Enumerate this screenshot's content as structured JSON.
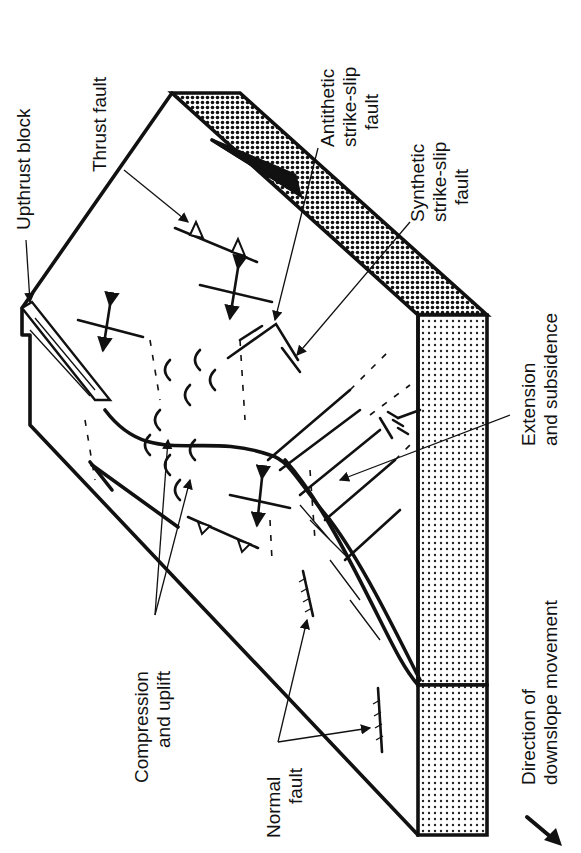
{
  "figure": {
    "type": "block-diagram",
    "orientation": "rotated 90° counter-clockwise (text reads bottom-to-top)",
    "colors": {
      "ink": "#111111",
      "background": "#ffffff",
      "stipple_fill": "#d9d9d9",
      "dense_stipple_fill": "#8c8c8c"
    }
  },
  "labels": {
    "upthrust_block": "Upthrust block",
    "thrust_fault": "Thrust fault",
    "antithetic": [
      "Antithetic",
      "strike-slip",
      "fault"
    ],
    "synthetic": [
      "Synthetic",
      "strike-slip",
      "fault"
    ],
    "extension": [
      "Extension",
      "and subsidence"
    ],
    "compression": [
      "Compression",
      "and uplift"
    ],
    "normal_fault": [
      "Normal",
      "fault"
    ],
    "direction": [
      "Direction of",
      "downslope movement"
    ]
  },
  "legend": {
    "arrow_icon": "bold-arrow-icon",
    "meaning": "Direction of downslope movement"
  },
  "symbols": [
    {
      "name": "thrust-fault-symbol",
      "glyph": "line with triangular teeth"
    },
    {
      "name": "normal-fault-symbol",
      "glyph": "line with ticks"
    },
    {
      "name": "strike-slip-symbol",
      "glyph": "paired half-arrows"
    },
    {
      "name": "compression-axis-symbol",
      "glyph": "line crossed by double-headed arrow"
    }
  ]
}
